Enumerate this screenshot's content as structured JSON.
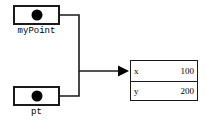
{
  "diagram": {
    "references": [
      {
        "label": "myPoint",
        "pointer_glyph": "filled-dot"
      },
      {
        "label": "pt",
        "pointer_glyph": "filled-dot"
      }
    ],
    "object": {
      "fields": [
        {
          "name": "x",
          "value": "100"
        },
        {
          "name": "y",
          "value": "200"
        }
      ]
    },
    "colors": {
      "stroke": "#1a1a1a",
      "dot": "#000000",
      "background": "#ffffff"
    }
  }
}
